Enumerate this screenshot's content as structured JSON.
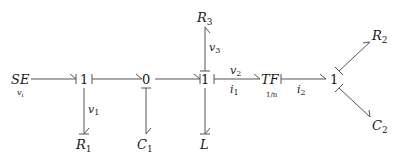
{
  "diagram": {
    "type": "bond-graph",
    "nodes": {
      "se": {
        "label": "SE",
        "sublabel": "v",
        "sublabel_sub": "i"
      },
      "j1a": {
        "label": "1"
      },
      "j0": {
        "label": "0"
      },
      "j1b": {
        "label": "1"
      },
      "tf": {
        "label": "TF",
        "ratio": "1/n"
      },
      "j1c": {
        "label": "1"
      },
      "r1": {
        "label": "R",
        "sub": "1"
      },
      "c1": {
        "label": "C",
        "sub": "1"
      },
      "l": {
        "label": "L"
      },
      "r3": {
        "label": "R",
        "sub": "3"
      },
      "r2": {
        "label": "R",
        "sub": "2"
      },
      "c2": {
        "label": "C",
        "sub": "2"
      }
    },
    "bond_labels": {
      "v1": {
        "var": "v",
        "sub": "1"
      },
      "v3": {
        "var": "v",
        "sub": "3"
      },
      "v2": {
        "var": "v",
        "sub": "2"
      },
      "i1": {
        "var": "i",
        "sub": "1"
      },
      "i2": {
        "var": "i",
        "sub": "2"
      }
    },
    "colors": {
      "bond": "#555555",
      "text": "#1a1a1a"
    }
  }
}
